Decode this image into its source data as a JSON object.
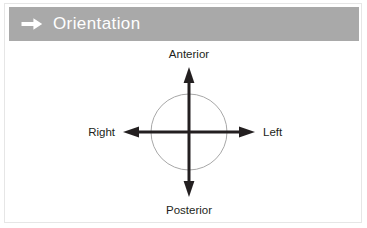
{
  "card": {
    "name": "orientation-panel"
  },
  "header": {
    "icon": "arrow-right-icon",
    "title": "Orientation",
    "background_color": "#a9a9a9",
    "text_color": "#ffffff"
  },
  "diagram": {
    "type": "anatomical-orientation-axes",
    "circle": {
      "cx": 184,
      "cy": 91,
      "r": 38,
      "stroke_color": "#a8a8a8"
    },
    "axis_color": "#231f20",
    "labels": {
      "top": "Anterior",
      "bottom": "Posterior",
      "left": "Right",
      "right": "Left"
    },
    "arrows": [
      {
        "name": "anterior-arrow",
        "direction": "up"
      },
      {
        "name": "posterior-arrow",
        "direction": "down"
      },
      {
        "name": "right-arrow",
        "direction": "left"
      },
      {
        "name": "left-arrow",
        "direction": "right"
      }
    ]
  }
}
